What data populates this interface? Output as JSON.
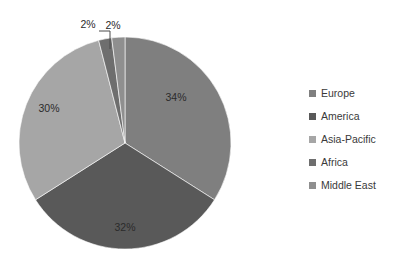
{
  "chart_data": {
    "type": "pie",
    "title": "",
    "subtitle": "",
    "xlabel": "",
    "ylabel": "",
    "legend_position": "right",
    "grid": false,
    "start_angle_deg": 0,
    "direction": "clockwise",
    "categories": [
      "Europe",
      "America",
      "Asia-Pacific",
      "Africa",
      "Middle East"
    ],
    "values": [
      34,
      32,
      30,
      2,
      2
    ],
    "value_unit": "%",
    "data_labels": [
      "34%",
      "32%",
      "30%",
      "2%",
      "2%"
    ],
    "colors": [
      "#7f7f7f",
      "#595959",
      "#a6a6a6",
      "#6e6e6e",
      "#8f8f8f"
    ],
    "slices": [
      {
        "name": "Europe",
        "value": 34,
        "label": "34%",
        "color": "#7f7f7f",
        "label_x": 176,
        "label_y": 101,
        "callout": false
      },
      {
        "name": "America",
        "value": 32,
        "label": "32%",
        "color": "#595959",
        "label_x": 125,
        "label_y": 231,
        "callout": false
      },
      {
        "name": "Asia-Pacific",
        "value": 30,
        "label": "30%",
        "color": "#a6a6a6",
        "label_x": 49,
        "label_y": 112,
        "callout": false
      },
      {
        "name": "Africa",
        "value": 2,
        "label": "2%",
        "color": "#6e6e6e",
        "label_x": 88,
        "label_y": 28,
        "callout": true
      },
      {
        "name": "Middle East",
        "value": 2,
        "label": "2%",
        "color": "#8f8f8f",
        "label_x": 113,
        "label_y": 29,
        "callout": true
      }
    ],
    "geometry": {
      "center_x": 125,
      "center_y": 143,
      "radius": 106
    }
  },
  "legend": {
    "items": [
      {
        "label": "Europe",
        "color": "#7f7f7f"
      },
      {
        "label": "America",
        "color": "#595959"
      },
      {
        "label": "Asia-Pacific",
        "color": "#a6a6a6"
      },
      {
        "label": "Africa",
        "color": "#6e6e6e"
      },
      {
        "label": "Middle East",
        "color": "#8f8f8f"
      }
    ]
  }
}
